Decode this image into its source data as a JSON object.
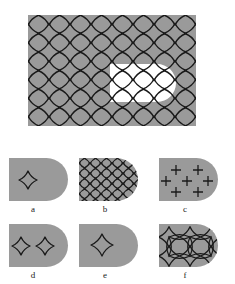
{
  "figure": {
    "type": "scientific-figure-schematic",
    "background_color": "#ffffff",
    "material_fill_color": "#9a9a9a",
    "void_fill_color": "#ffffff",
    "mesh_line_color": "#1a1a1a",
    "main_panel": {
      "name": "main-domain",
      "shape": "rectangle-with-D-shaped-void",
      "rect": {
        "x": 28,
        "y": 15,
        "width": 168,
        "height": 111
      },
      "void": {
        "shape": "D",
        "x": 110,
        "y": 64,
        "width": 66,
        "height": 38,
        "flat_side": "left",
        "round_side": "right"
      },
      "mesh": {
        "pattern": "four-pointed-star-lattice",
        "columns": 8,
        "rows": 6,
        "cell_width": 21,
        "cell_height": 18.5
      }
    },
    "sub_panels": [
      {
        "id": "a",
        "label": "a",
        "name": "panel-a",
        "outline": {
          "x": 9,
          "y": 158,
          "width": 59,
          "height": 43
        },
        "label_pos": {
          "x": 33,
          "y": 212
        },
        "mesh": {
          "pattern": "four-pointed-star",
          "count": 1,
          "columns": 1,
          "rows": 1
        },
        "stars": [
          {
            "cx": 28,
            "cy": 180,
            "r": 9
          }
        ],
        "crosses": []
      },
      {
        "id": "b",
        "label": "b",
        "name": "panel-b",
        "outline": {
          "x": 79,
          "y": 158,
          "width": 59,
          "height": 43
        },
        "label_pos": {
          "x": 105,
          "y": 212
        },
        "mesh": {
          "pattern": "four-pointed-star-lattice",
          "count": 20,
          "columns": 5,
          "rows": 4
        },
        "stars": [],
        "crosses": []
      },
      {
        "id": "c",
        "label": "c",
        "name": "panel-c",
        "outline": {
          "x": 159,
          "y": 158,
          "width": 59,
          "height": 43
        },
        "label_pos": {
          "x": 185,
          "y": 212
        },
        "mesh": {
          "pattern": "plus-marks",
          "count": 7,
          "columns": 3,
          "rows": 3
        },
        "stars": [],
        "crosses": [
          {
            "cx": 176,
            "cy": 170,
            "r": 5
          },
          {
            "cx": 198,
            "cy": 170,
            "r": 5
          },
          {
            "cx": 166,
            "cy": 181,
            "r": 5
          },
          {
            "cx": 187,
            "cy": 181,
            "r": 5
          },
          {
            "cx": 208,
            "cy": 181,
            "r": 5
          },
          {
            "cx": 176,
            "cy": 192,
            "r": 5
          },
          {
            "cx": 198,
            "cy": 192,
            "r": 5
          }
        ]
      },
      {
        "id": "d",
        "label": "d",
        "name": "panel-d",
        "outline": {
          "x": 9,
          "y": 224,
          "width": 59,
          "height": 43
        },
        "label_pos": {
          "x": 33,
          "y": 278
        },
        "mesh": {
          "pattern": "four-pointed-star",
          "count": 2,
          "columns": 2,
          "rows": 1
        },
        "stars": [
          {
            "cx": 21,
            "cy": 246,
            "r": 9
          },
          {
            "cx": 45,
            "cy": 246,
            "r": 9
          }
        ],
        "crosses": []
      },
      {
        "id": "e",
        "label": "e",
        "name": "panel-e",
        "outline": {
          "x": 79,
          "y": 224,
          "width": 59,
          "height": 43
        },
        "label_pos": {
          "x": 105,
          "y": 278
        },
        "mesh": {
          "pattern": "four-pointed-star",
          "count": 1,
          "columns": 1,
          "rows": 1
        },
        "stars": [
          {
            "cx": 102,
            "cy": 245,
            "r": 11
          }
        ],
        "crosses": []
      },
      {
        "id": "f",
        "label": "f",
        "name": "panel-f",
        "outline": {
          "x": 159,
          "y": 224,
          "width": 59,
          "height": 43
        },
        "label_pos": {
          "x": 185,
          "y": 278
        },
        "mesh": {
          "pattern": "four-pointed-star-lattice",
          "count": 6,
          "columns": 3,
          "rows": 2
        },
        "stars": [
          {
            "cx": 169,
            "cy": 237,
            "r": 9
          },
          {
            "cx": 190,
            "cy": 237,
            "r": 9
          },
          {
            "cx": 211,
            "cy": 237,
            "r": 9
          },
          {
            "cx": 169,
            "cy": 256,
            "r": 9
          },
          {
            "cx": 190,
            "cy": 256,
            "r": 9
          },
          {
            "cx": 211,
            "cy": 256,
            "r": 9
          }
        ],
        "crosses": []
      }
    ]
  }
}
